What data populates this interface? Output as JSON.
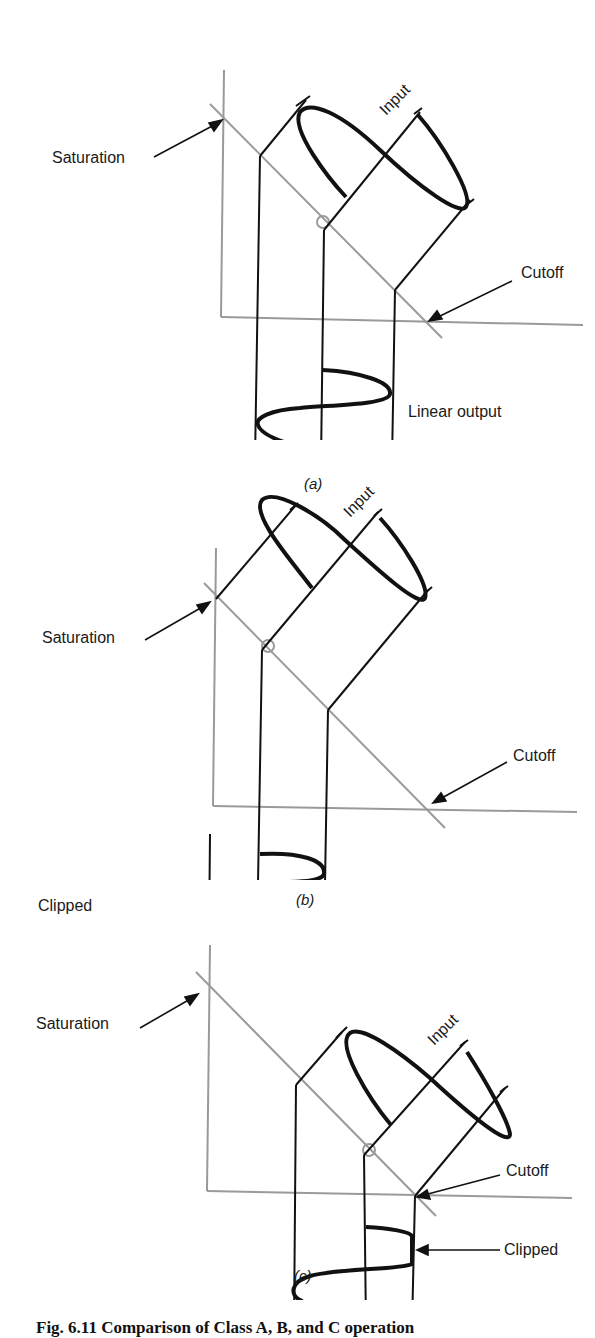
{
  "figure": {
    "caption": "Fig. 6.11  Comparison of Class A, B, and C operation",
    "panels": [
      {
        "id": "a",
        "sublabel": "(a)",
        "labels": {
          "saturation": "Saturation",
          "cutoff": "Cutoff",
          "input": "Input",
          "output": "Linear output"
        }
      },
      {
        "id": "b",
        "sublabel": "(b)",
        "labels": {
          "saturation": "Saturation",
          "cutoff": "Cutoff",
          "input": "Input",
          "output": "Clipped"
        }
      },
      {
        "id": "c",
        "sublabel": "(c)",
        "labels": {
          "saturation": "Saturation",
          "cutoff": "Cutoff",
          "input": "Input",
          "output": "Clipped"
        }
      }
    ],
    "colors": {
      "axis": "#9a9a9a",
      "load_line": "#9a9a9a",
      "q_point": "#9a9a9a",
      "signal": "#111111",
      "projection": "#111111"
    }
  }
}
